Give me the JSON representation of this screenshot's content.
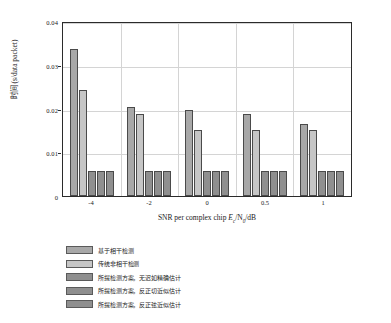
{
  "chart_data": {
    "type": "bar",
    "title": "",
    "subtitle": "",
    "xlabel": "SNR per complex chip E_c/N_0/dB",
    "xlabel_parts": {
      "prefix": "SNR per complex chip ",
      "sym1": "E",
      "sub1": "c",
      "slash1": "/N",
      "sub2": "0",
      "suffix": "/dB"
    },
    "ylabel": "时间 (s/data packet)",
    "categories": [
      "-4",
      "-2",
      "0",
      "0.5",
      "1"
    ],
    "ylim": [
      0,
      0.04
    ],
    "xlim_note": "categorical",
    "yticks": [
      "0",
      "0.01",
      "0.02",
      "0.03",
      "0.04"
    ],
    "ytick_values": [
      0,
      0.01,
      0.02,
      0.03,
      0.04
    ],
    "grid": true,
    "legend_position": "below-axes-left",
    "series": [
      {
        "name": "基于相干检测",
        "color": "#a8a8a8",
        "values": [
          0.0337,
          0.0203,
          0.0196,
          0.0188,
          0.0165
        ]
      },
      {
        "name": "传统非相干检测",
        "color": "#c6c6c6",
        "values": [
          0.0243,
          0.0188,
          0.015,
          0.015,
          0.015
        ]
      },
      {
        "name": "所提检测方案，无迟如精确估计",
        "color": "#8f8f8f",
        "values": [
          0.0058,
          0.0058,
          0.0058,
          0.0058,
          0.0058
        ]
      },
      {
        "name": "所提检测方案，反正切近似估计",
        "color": "#8f8f8f",
        "values": [
          0.0058,
          0.0058,
          0.0058,
          0.0058,
          0.0058
        ]
      },
      {
        "name": "所提检测方案，反正弦近似估计",
        "color": "#8f8f8f",
        "values": [
          0.0058,
          0.0058,
          0.0058,
          0.0058,
          0.0058
        ]
      }
    ]
  },
  "colors": {
    "axis": "#2b2b2b",
    "grid": "#d4d4d4",
    "background": "#ffffff",
    "bar_edge": "#4a4a4a"
  }
}
